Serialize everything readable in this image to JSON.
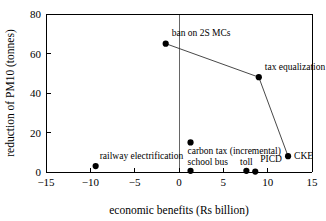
{
  "chart_data": {
    "type": "scatter",
    "title": "",
    "xlabel": "economic benefits (Rs billion)",
    "ylabel": "reduction of PM10 (tonnes)",
    "xlim": [
      -15,
      15
    ],
    "ylim": [
      0,
      80
    ],
    "xticks": [
      "-15",
      "-10",
      "-5",
      "0",
      "5",
      "10",
      "15"
    ],
    "xtick_values": [
      -15,
      -10,
      -5,
      0,
      5,
      10,
      15
    ],
    "yticks": [
      "0",
      "20",
      "40",
      "60",
      "80"
    ],
    "ytick_values": [
      0,
      20,
      40,
      60,
      80
    ],
    "grid": false,
    "legend": "none",
    "zero_reference_line_x": 0,
    "points": [
      {
        "label": "ban on 2S MCs",
        "x": -1.5,
        "y": 65.0,
        "label_dx": 6,
        "label_dy": -8,
        "anchor": "start"
      },
      {
        "label": "tax equalization",
        "x": 9.0,
        "y": 48.0,
        "label_dx": 6,
        "label_dy": -7,
        "anchor": "start"
      },
      {
        "label": "CKE",
        "x": 12.3,
        "y": 8.0,
        "label_dx": 6,
        "label_dy": 3,
        "anchor": "start"
      },
      {
        "label": "carbon tax (incremental)",
        "x": 1.3,
        "y": 15.0,
        "label_dx": -3,
        "label_dy": 12,
        "anchor": "start"
      },
      {
        "label": "school bus",
        "x": 1.3,
        "y": 0.6,
        "label_dx": -3,
        "label_dy": -6,
        "anchor": "start"
      },
      {
        "label": "toll",
        "x": 7.6,
        "y": 0.6,
        "label_dx": 0,
        "label_dy": -6,
        "anchor": "middle"
      },
      {
        "label": "PICD",
        "x": 8.6,
        "y": 0.2,
        "label_dx": 5,
        "label_dy": -10,
        "anchor": "start"
      },
      {
        "label": "railway electrification",
        "x": -9.4,
        "y": 3.0,
        "label_dx": 4,
        "label_dy": -7,
        "anchor": "start"
      }
    ],
    "connector_series": {
      "name": "frontier",
      "points": [
        {
          "x": -1.5,
          "y": 65.0
        },
        {
          "x": 9.0,
          "y": 48.0
        },
        {
          "x": 12.3,
          "y": 8.0
        }
      ]
    }
  },
  "colors": {
    "marker": "#000000",
    "axis": "#000000",
    "line": "#333333",
    "zero_line": "#555555",
    "background": "#ffffff"
  }
}
